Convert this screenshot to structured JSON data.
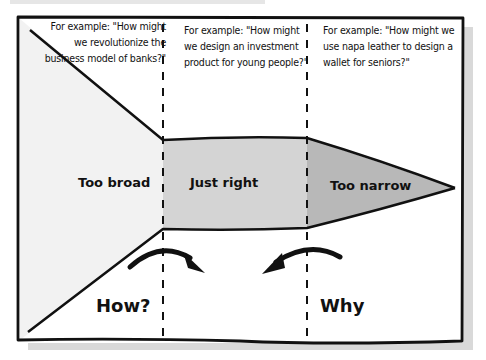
{
  "diagram": {
    "examples": [
      {
        "id": "broad",
        "text": "For example: \"How might we revolutionize the business model of banks?\""
      },
      {
        "id": "right",
        "text": "For example: \"How might we design an investment product for young people?\""
      },
      {
        "id": "narrow",
        "text": "For example: \"How might we use napa leather to design a wallet for seniors?\""
      }
    ],
    "zones": [
      {
        "id": "too-broad",
        "label": "Too broad"
      },
      {
        "id": "just-right",
        "label": "Just right"
      },
      {
        "id": "too-narrow",
        "label": "Too narrow"
      }
    ],
    "questions": {
      "how": "How?",
      "why": "Why"
    },
    "colors": {
      "border": "#111111",
      "too_broad_fill": "#f2f2f2",
      "just_right_fill": "#d4d4d4",
      "too_narrow_fill": "#b8b8b8",
      "shadow": "#d9d9d9",
      "background": "#ffffff"
    }
  }
}
